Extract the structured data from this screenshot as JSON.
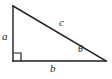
{
  "figure": {
    "kind": "right-triangle-diagram",
    "background_color": "#ffffff",
    "stroke_color": "#231f20",
    "stroke_width": 1.4,
    "width": 112,
    "height": 79
  },
  "geometry": {
    "vertices": {
      "top": {
        "x": 13,
        "y": 6
      },
      "bottom_left": {
        "x": 13,
        "y": 61
      },
      "bottom_right": {
        "x": 106,
        "y": 61
      }
    },
    "right_angle_marker": {
      "at": "bottom_left",
      "size": 8
    }
  },
  "labels": {
    "leg_vertical": "a",
    "leg_horizontal": "b",
    "hypotenuse": "c",
    "angle": "θ"
  }
}
